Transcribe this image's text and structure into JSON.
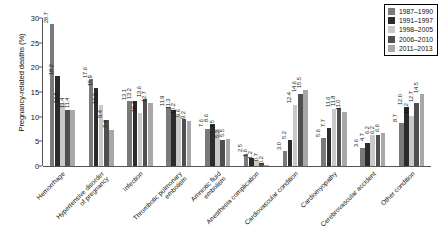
{
  "chart_data": {
    "type": "bar",
    "title": "",
    "xlabel": "",
    "ylabel": "Pregnancy-related deaths (%)",
    "ylim": [
      0,
      30
    ],
    "ytick_labels": [
      "0",
      "5",
      "10",
      "15",
      "20",
      "25",
      "30"
    ],
    "grid": false,
    "legend_position": "top-right",
    "categories": [
      "Hemorrhage",
      "Hypertensive disorder\nof pregnancy",
      "Infection",
      "Thrombotic pulmonary\nembolism",
      "Amniotic fluid\nembolism",
      "Anesthesia complication",
      "Cardiovascular condition",
      "Cardiomyopathy",
      "Cerebrovascular accident",
      "Other condition"
    ],
    "series": [
      {
        "name": "1987-1990",
        "color": "#7a7a7a",
        "values": [
          28.7,
          17.6,
          13.1,
          11.9,
          7.6,
          2.5,
          3.0,
          5.6,
          3.6,
          8.7
        ]
      },
      {
        "name": "1991-1997",
        "color": "#2b2b2b",
        "values": [
          18.2,
          15.9,
          13.2,
          11.3,
          8.6,
          1.6,
          5.2,
          7.7,
          4.7,
          12.0
        ]
      },
      {
        "name": "1998-2005",
        "color": "#c9c9c9",
        "values": [
          12.5,
          12.3,
          10.7,
          10.2,
          7.5,
          1.2,
          12.4,
          11.6,
          6.2,
          10.2
        ]
      },
      {
        "name": "2006-2010",
        "color": "#4f4f4f",
        "values": [
          11.4,
          9.4,
          13.6,
          9.6,
          5.3,
          0.7,
          14.6,
          11.8,
          6.2,
          12.7
        ]
      },
      {
        "name": "2011-2013",
        "color": "#a8a8a8",
        "values": [
          11.4,
          7.4,
          12.7,
          9.2,
          5.5,
          0.2,
          15.5,
          11.0,
          6.6,
          14.5
        ]
      }
    ]
  },
  "legend": {
    "items": [
      {
        "label": "1987–1990",
        "color": "#7a7a7a"
      },
      {
        "label": "1991–1997",
        "color": "#2b2b2b"
      },
      {
        "label": "1998–2005",
        "color": "#c9c9c9"
      },
      {
        "label": "2006–2010",
        "color": "#4f4f4f"
      },
      {
        "label": "2011–2013",
        "color": "#a8a8a8"
      }
    ]
  }
}
